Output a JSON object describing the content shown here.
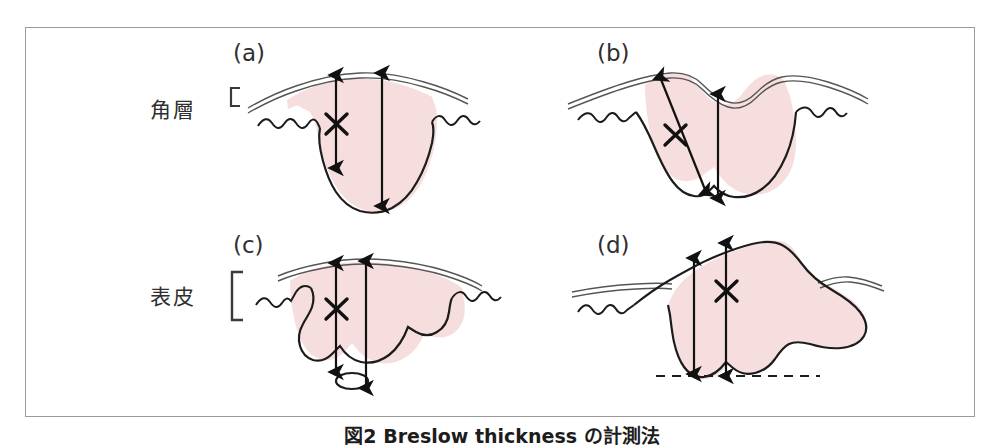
{
  "figure": {
    "caption": "図2 Breslow thickness の計測法",
    "background_color": "#ffffff",
    "frame_border_color": "#9a9a9a",
    "lesion_fill_color": "#f7dede",
    "outline_color": "#1c1c1c",
    "skin_line_color": "#555555"
  },
  "row_labels": [
    {
      "id": "corneum",
      "text": "角層",
      "bracket": "small"
    },
    {
      "id": "epidermis",
      "text": "表皮",
      "bracket": "tall"
    }
  ],
  "panels": [
    {
      "id": "a",
      "tag": "(a)",
      "description": "通常の結節型病変：正しい計測は顆粒層上端から腫瘍最深部まで",
      "arrows": [
        {
          "name": "incorrect-measure-arrow",
          "marked_invalid": true,
          "mark": "×"
        },
        {
          "name": "correct-measure-arrow",
          "marked_invalid": false,
          "mark": ""
        }
      ]
    },
    {
      "id": "b",
      "tag": "(b)",
      "description": "斜めに計測した例は不正確、垂直方向の計測が正しい",
      "arrows": [
        {
          "name": "incorrect-oblique-arrow",
          "marked_invalid": true,
          "mark": "×"
        },
        {
          "name": "correct-vertical-arrow",
          "marked_invalid": false,
          "mark": ""
        }
      ]
    },
    {
      "id": "c",
      "tag": "(c)",
      "description": "衛星病巣がある場合は最深部の独立小結節までを計測",
      "arrows": [
        {
          "name": "incorrect-measure-arrow",
          "marked_invalid": true,
          "mark": "×"
        },
        {
          "name": "correct-measure-arrow",
          "marked_invalid": false,
          "mark": ""
        }
      ]
    },
    {
      "id": "d",
      "tag": "(d)",
      "description": "外向性（隆起性）病変では腫瘍頂部から最深部までを計測",
      "arrows": [
        {
          "name": "correct-measure-arrow",
          "marked_invalid": false,
          "mark": ""
        },
        {
          "name": "incorrect-measure-arrow",
          "marked_invalid": true,
          "mark": "×"
        }
      ],
      "baseline": "dashed"
    }
  ],
  "marks": {
    "invalid_symbol": "×"
  }
}
